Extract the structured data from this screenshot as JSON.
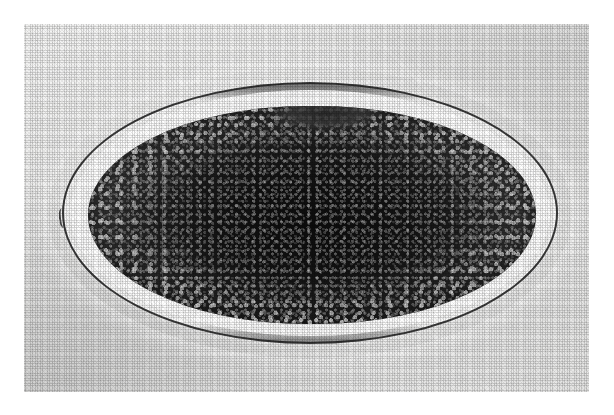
{
  "figure": {
    "domain": "Natural-Image",
    "caption": "",
    "page_background_color": "#ffffff",
    "print_background_color": "#e9e9e8",
    "reproduction": "halftone-screened black-and-white photographic print"
  },
  "photo_plate": {
    "name": "micrograph-print",
    "left": 24,
    "top": 24,
    "width": 565,
    "height": 368,
    "border": "none",
    "tone_range_hex": [
      "#0c0c0c",
      "#ececeb"
    ]
  },
  "specimen": {
    "label": "egg",
    "shape": "ellipse",
    "orientation": "horizontal",
    "shell": {
      "name": "egg-shell-wall",
      "description": "thin smooth translucent shell outline",
      "line_color_hex": "#3a3a3a",
      "thickness_px": 2,
      "left": 62,
      "top": 82,
      "width": 496,
      "height": 262
    },
    "perivitelline_space": {
      "name": "perivitelline-space",
      "description": "bright clear gap between shell and embryo",
      "color_hex": "#f8f8f7"
    },
    "embryo": {
      "name": "embryonic-mass",
      "description": "dense dark granular embryonic / yolk mass filling most of the shell",
      "core_color_hex": "#0c0c0c",
      "edge_color_hex": "#6d6d6d",
      "texture": "coarse granular speckle, lighter at the periphery",
      "left": 86,
      "top": 104,
      "width": 448,
      "height": 218
    },
    "features": [
      {
        "name": "shell-pole-notch",
        "description": "small notch/kink in the shell at the left pole"
      },
      {
        "name": "embryo-top-bulge",
        "description": "irregular bulge on the upper contour of the embryonic mass"
      },
      {
        "name": "scan-line-artifact",
        "description": "faint vertical reproduction line crossing the left of the specimen"
      }
    ]
  }
}
